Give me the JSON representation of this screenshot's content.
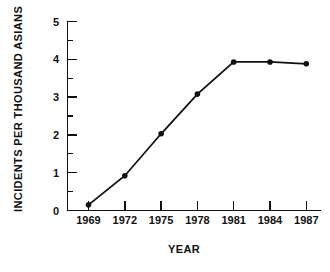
{
  "chart_data": {
    "type": "line",
    "title": "",
    "subtitle": "",
    "xlabel": "YEAR",
    "ylabel": "INCIDENTS PER THOUSAND ASIANS",
    "x": [
      1969,
      1972,
      1975,
      1978,
      1981,
      1984,
      1987
    ],
    "categories": [
      "1969",
      "1972",
      "1975",
      "1978",
      "1981",
      "1984",
      "1987"
    ],
    "values": [
      0.15,
      0.92,
      2.03,
      3.08,
      3.93,
      3.93,
      3.88
    ],
    "series": [
      {
        "name": "Incidents per thousand Asians",
        "values": [
          0.15,
          0.92,
          2.03,
          3.08,
          3.93,
          3.93,
          3.88
        ]
      }
    ],
    "xlim": [
      1968,
      1988.5
    ],
    "ylim": [
      0,
      5
    ],
    "ytick_labels": [
      "0",
      "1",
      "2",
      "3",
      "4",
      "5"
    ],
    "ytick_values": [
      0,
      1,
      2,
      3,
      4,
      5
    ],
    "yminor_values": [
      0.5,
      1.5,
      2.5,
      3.5,
      4.5
    ],
    "xtick_labels": [
      "1969",
      "1972",
      "1975",
      "1978",
      "1981",
      "1984",
      "1987"
    ],
    "grid": false,
    "legend": null,
    "legend_position": "none",
    "marker": "circle",
    "line_color": "#111111",
    "marker_color": "#111111",
    "background_color": "#ffffff"
  },
  "figure": {
    "y_axis_label": "INCIDENTS PER THOUSAND ASIANS",
    "x_axis_label": "YEAR",
    "y_tick_0": "0",
    "y_tick_1": "1",
    "y_tick_2": "2",
    "y_tick_3": "3",
    "y_tick_4": "4",
    "y_tick_5": "5",
    "x_tick_0": "1969",
    "x_tick_1": "1972",
    "x_tick_2": "1975",
    "x_tick_3": "1978",
    "x_tick_4": "1981",
    "x_tick_5": "1984",
    "x_tick_6": "1987"
  }
}
